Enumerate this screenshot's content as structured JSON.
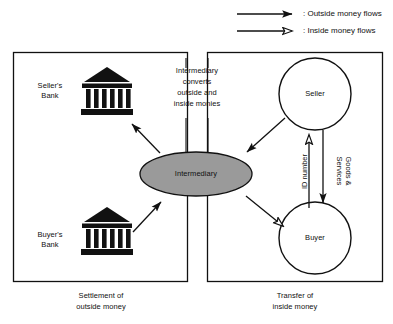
{
  "figure": {
    "legend": {
      "items": [
        {
          "label": ": Outside money flows",
          "arrow_style": "solid-head",
          "name": "outside-money-flows"
        },
        {
          "label": ": Inside money flows",
          "arrow_style": "open-head",
          "name": "inside-money-flows"
        }
      ]
    },
    "panels": [
      {
        "id": "left",
        "caption": "Settlement of\noutside money"
      },
      {
        "id": "right",
        "caption": "Transfer of\ninside money"
      }
    ],
    "nodes": [
      {
        "id": "sellers-bank",
        "label": "Seller's\nBank",
        "shape": "bank-icon"
      },
      {
        "id": "buyers-bank",
        "label": "Buyer's\nBank",
        "shape": "bank-icon"
      },
      {
        "id": "intermediary",
        "label": "Intermediary",
        "shape": "ellipse",
        "fill": "#9a9a9a"
      },
      {
        "id": "seller",
        "label": "Seller",
        "shape": "circle"
      },
      {
        "id": "buyer",
        "label": "Buyer",
        "shape": "circle"
      }
    ],
    "annotations": [
      {
        "id": "intermediary-note",
        "text": "Intermediary\nconverts\noutside and\ninside monies"
      }
    ],
    "edges": [
      {
        "id": "intermediary-to-sellers-bank",
        "label": "",
        "head": "solid"
      },
      {
        "id": "buyers-bank-to-intermediary",
        "label": "",
        "head": "solid"
      },
      {
        "id": "seller-to-intermediary",
        "label": "",
        "head": "solid"
      },
      {
        "id": "intermediary-to-buyer",
        "label": "",
        "head": "open"
      },
      {
        "id": "buyer-to-seller",
        "label": "ID number",
        "head": "open"
      },
      {
        "id": "seller-to-buyer",
        "label": "Goods &\nServices",
        "head": "solid"
      }
    ],
    "colors": {
      "stroke": "#111111",
      "ellipse_fill": "#9a9a9a",
      "background": "#ffffff"
    }
  }
}
